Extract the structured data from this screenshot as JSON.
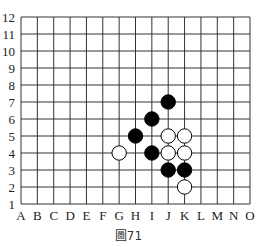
{
  "diagram": {
    "columns": [
      "A",
      "B",
      "C",
      "D",
      "E",
      "F",
      "G",
      "H",
      "I",
      "J",
      "K",
      "L",
      "M",
      "N",
      "O"
    ],
    "rows": [
      "1",
      "2",
      "3",
      "4",
      "5",
      "6",
      "7",
      "8",
      "9",
      "10",
      "11",
      "12"
    ],
    "stones": [
      {
        "color": "black",
        "col": "J",
        "row": 7
      },
      {
        "color": "black",
        "col": "I",
        "row": 6
      },
      {
        "color": "black",
        "col": "H",
        "row": 5
      },
      {
        "color": "black",
        "col": "I",
        "row": 4
      },
      {
        "color": "black",
        "col": "J",
        "row": 3
      },
      {
        "color": "black",
        "col": "K",
        "row": 3
      },
      {
        "color": "white",
        "col": "G",
        "row": 4
      },
      {
        "color": "white",
        "col": "J",
        "row": 5
      },
      {
        "color": "white",
        "col": "K",
        "row": 5
      },
      {
        "color": "white",
        "col": "J",
        "row": 4
      },
      {
        "color": "white",
        "col": "K",
        "row": 4
      },
      {
        "color": "white",
        "col": "K",
        "row": 2
      }
    ],
    "caption": "圖71",
    "colors": {
      "line": "#333333",
      "black_stone": "#000000",
      "white_stone": "#ffffff"
    }
  }
}
